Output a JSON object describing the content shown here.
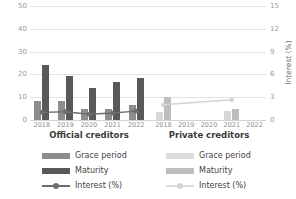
{
  "chart_data": {
    "type": "bar",
    "title": "",
    "xlabel": "",
    "ylabel": "Years",
    "y2label": "Interest (%)",
    "ylim": [
      0,
      60
    ],
    "y2lim": [
      0,
      18
    ],
    "yticks": [
      0,
      10,
      20,
      30,
      40,
      50
    ],
    "y2ticks": [
      0,
      3,
      6,
      9,
      12,
      15
    ],
    "grid": true,
    "legend_position": "bottom",
    "categories": [
      "2018",
      "2019",
      "2020",
      "2021",
      "2022"
    ],
    "panels": [
      {
        "name": "official",
        "caption": "Official creditors",
        "series": [
          {
            "name": "Grace period",
            "axis": "left",
            "type": "bar",
            "color": "#8d8d8d",
            "values": [
              10,
              10,
              6,
              6,
              8
            ]
          },
          {
            "name": "Maturity",
            "axis": "left",
            "type": "bar",
            "color": "#595959",
            "values": [
              29,
              23,
              17,
              20,
              22
            ]
          },
          {
            "name": "Interest (%)",
            "axis": "right",
            "type": "line",
            "color": "#6e6e6e",
            "values": [
              1.2,
              1.3,
              0.9,
              1.1,
              1.4
            ]
          }
        ]
      },
      {
        "name": "private",
        "caption": "Private creditors",
        "series": [
          {
            "name": "Grace period",
            "axis": "left",
            "type": "bar",
            "color": "#d8d8d8",
            "values": [
              4,
              null,
              null,
              5,
              null
            ]
          },
          {
            "name": "Maturity",
            "axis": "left",
            "type": "bar",
            "color": "#bdbdbd",
            "values": [
              12,
              null,
              null,
              6,
              null
            ]
          },
          {
            "name": "Interest (%)",
            "axis": "right",
            "type": "line",
            "color": "#d4d4d4",
            "values": [
              2.4,
              null,
              null,
              3.2,
              null
            ]
          }
        ]
      }
    ]
  },
  "axes": {
    "left_title": "Years",
    "right_title": "Interest (%)",
    "left_ticks": [
      "50",
      "40",
      "30",
      "20",
      "10",
      "0"
    ],
    "right_ticks": [
      "15",
      "12",
      "9",
      "6",
      "3",
      "0"
    ]
  },
  "panel_captions": {
    "official": "Official creditors",
    "private": "Private creditors"
  },
  "xaxis": {
    "official": [
      "2018",
      "2019",
      "2020",
      "2021",
      "2022"
    ],
    "private": [
      "2018",
      "2019",
      "2020",
      "2021",
      "2022"
    ]
  },
  "legend": {
    "official": [
      {
        "label": "Grace period",
        "marker": "swatch-grace-official"
      },
      {
        "label": "Maturity",
        "marker": "swatch-maturity-official"
      },
      {
        "label": "Interest (%)",
        "marker": "line-marker-interest-official"
      }
    ],
    "private": [
      {
        "label": "Grace period",
        "marker": "swatch-grace-private"
      },
      {
        "label": "Maturity",
        "marker": "swatch-maturity-private"
      },
      {
        "label": "Interest (%)",
        "marker": "line-marker-interest-private"
      }
    ]
  },
  "colors": {
    "grace_official": "#8d8d8d",
    "maturity_official": "#595959",
    "interest_official": "#6e6e6e",
    "grace_private": "#d8d8d8",
    "maturity_private": "#bdbdbd",
    "interest_private": "#d4d4d4",
    "grid": "#e3e3e3",
    "tick_text": "#9a9a9a"
  }
}
